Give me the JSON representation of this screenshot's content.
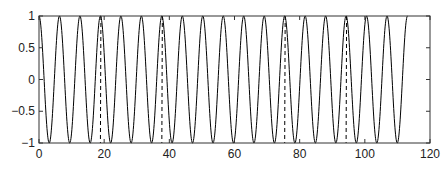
{
  "chart_data": {
    "type": "line",
    "title": "",
    "xlabel": "",
    "ylabel": "",
    "xlim": [
      0,
      120
    ],
    "ylim": [
      -1,
      1
    ],
    "xticks": [
      0,
      20,
      40,
      60,
      80,
      100,
      120
    ],
    "xtick_labels": [
      "0",
      "20",
      "40",
      "60",
      "80",
      "100",
      "120"
    ],
    "yticks": [
      -1,
      -0.5,
      0,
      0.5,
      1
    ],
    "ytick_labels": [
      "−1",
      "−0.5",
      "0",
      "0.5",
      "1"
    ],
    "grid": false,
    "legend": null,
    "series": [
      {
        "name": "cos(x)",
        "style": "solid",
        "color": "#000000",
        "function": "cos",
        "x_range": [
          0,
          113.1
        ]
      },
      {
        "name": "dashed transitions",
        "style": "dashed",
        "color": "#000000",
        "segments": [
          {
            "x": [
              18.85,
              18.85
            ],
            "y": [
              1,
              -1
            ]
          },
          {
            "x": [
              37.7,
              37.7
            ],
            "y": [
              1,
              -1
            ]
          },
          {
            "x": [
              75.4,
              75.4
            ],
            "y": [
              1,
              -1
            ]
          },
          {
            "x": [
              94.25,
              94.25
            ],
            "y": [
              1,
              -1
            ]
          }
        ]
      }
    ]
  }
}
